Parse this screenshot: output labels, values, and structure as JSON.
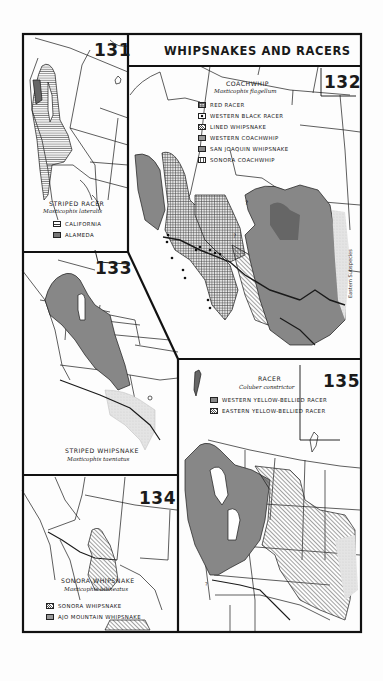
{
  "page": {
    "title": "WHIPSNAKES AND RACERS",
    "background": "#fdfdfd",
    "ink": "#1a1a1a"
  },
  "maps": [
    {
      "number": "131",
      "common_name": "STRIPED RACER",
      "scientific_name": "Masticophis lateralis",
      "legend": [
        {
          "label": "CALIFORNIA",
          "pattern": "horizontal-lines"
        },
        {
          "label": "ALAMEDA",
          "pattern": "dense-crosshatch"
        }
      ]
    },
    {
      "number": "132",
      "common_name": "COACHWHIP",
      "scientific_name": "Masticophis flagellum",
      "legend": [
        {
          "label": "RED RACER",
          "pattern": "grid"
        },
        {
          "label": "WESTERN BLACK RACER",
          "pattern": "dot"
        },
        {
          "label": "LINED WHIPSNAKE",
          "pattern": "diagonal-lines"
        },
        {
          "label": "WESTERN COACHWHIP",
          "pattern": "fine-crosshatch"
        },
        {
          "label": "SAN JOAQUIN WHIPSNAKE",
          "pattern": "dark-hatch"
        },
        {
          "label": "SONORA COACHWHIP",
          "pattern": "vertical-lines"
        }
      ],
      "annotations": [
        "Eastern Subspecies",
        "?",
        "?"
      ]
    },
    {
      "number": "133",
      "common_name": "STRIPED WHIPSNAKE",
      "scientific_name": "Masticophis taeniatus",
      "legend": []
    },
    {
      "number": "134",
      "common_name": "SONORA WHIPSNAKE",
      "scientific_name": "Masticophis bilineatus",
      "legend": [
        {
          "label": "SONORA WHIPSNAKE",
          "pattern": "diagonal-lines"
        },
        {
          "label": "AJO MOUNTAIN WHIPSNAKE",
          "pattern": "crosshatch"
        }
      ]
    },
    {
      "number": "135",
      "common_name": "RACER",
      "scientific_name": "Coluber constrictor",
      "legend": [
        {
          "label": "WESTERN YELLOW-BELLIED RACER",
          "pattern": "dark-hatch"
        },
        {
          "label": "EASTERN YELLOW-BELLIED RACER",
          "pattern": "diagonal-lines"
        }
      ],
      "annotations": [
        "?"
      ]
    }
  ]
}
